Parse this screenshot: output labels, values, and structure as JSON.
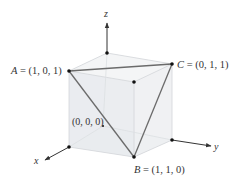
{
  "figure": {
    "type": "3d-cube-diagram",
    "axes": {
      "x": {
        "label": "x"
      },
      "y": {
        "label": "y"
      },
      "z": {
        "label": "z"
      }
    },
    "points": {
      "A": {
        "name": "A",
        "coords": "(1, 0, 1)",
        "label": "A = (1, 0, 1)"
      },
      "B": {
        "name": "B",
        "coords": "(1, 1, 0)",
        "label": "B = (1, 1, 0)"
      },
      "C": {
        "name": "C",
        "coords": "(0, 1, 1)",
        "label": "C = (0, 1, 1)"
      },
      "origin": {
        "label": "(0, 0, 0)"
      }
    },
    "triangle": [
      "A",
      "B",
      "C"
    ],
    "colors": {
      "cube_fill": "#eef0f2",
      "cube_edge": "#d6d9dc",
      "triangle_edge": "#6d6d6d",
      "axis": "#333333",
      "vertex": "#111111"
    }
  }
}
